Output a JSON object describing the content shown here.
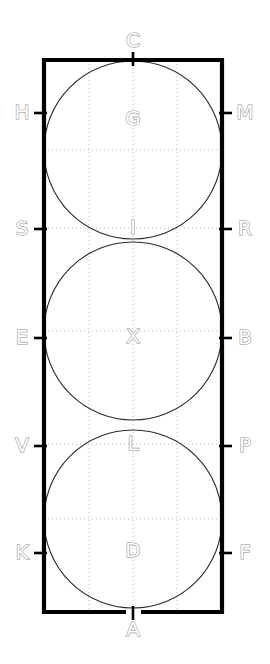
{
  "diagram": {
    "colors": {
      "frame": "#000000",
      "circle": "#2b2b2b",
      "grid": "#b9b9b9",
      "label_stroke": "#8c8c8c",
      "label_fill": "#ffffff",
      "background": "#ffffff"
    },
    "frame": {
      "left": 44,
      "right": 222,
      "top": 60,
      "bottom": 612,
      "width": 178,
      "height": 552
    },
    "circles": [
      {
        "id": "circle-top",
        "cx": 133,
        "cy": 150,
        "r": 89,
        "inner_label": "G"
      },
      {
        "id": "circle-middle",
        "cx": 133,
        "cy": 331,
        "r": 89,
        "inner_label": "X"
      },
      {
        "id": "circle-bottom",
        "cx": 133,
        "cy": 519,
        "r": 89,
        "inner_label": "D"
      }
    ],
    "labels": {
      "top": {
        "text": "C",
        "x": 133,
        "y": 41
      },
      "bottom": {
        "text": "A",
        "x": 133,
        "y": 630
      },
      "left": [
        {
          "text": "H",
          "x": 22,
          "y": 113
        },
        {
          "text": "S",
          "x": 22,
          "y": 229
        },
        {
          "text": "E",
          "x": 22,
          "y": 338
        },
        {
          "text": "V",
          "x": 22,
          "y": 446
        },
        {
          "text": "K",
          "x": 22,
          "y": 553
        }
      ],
      "right": [
        {
          "text": "M",
          "x": 245,
          "y": 113
        },
        {
          "text": "R",
          "x": 245,
          "y": 229
        },
        {
          "text": "B",
          "x": 245,
          "y": 338
        },
        {
          "text": "P",
          "x": 245,
          "y": 446
        },
        {
          "text": "F",
          "x": 245,
          "y": 553
        }
      ],
      "interior": [
        {
          "text": "G",
          "x": 133,
          "y": 119
        },
        {
          "text": "I",
          "x": 133,
          "y": 228
        },
        {
          "text": "X",
          "x": 133,
          "y": 337
        },
        {
          "text": "L",
          "x": 133,
          "y": 444
        },
        {
          "text": "D",
          "x": 133,
          "y": 551
        }
      ]
    },
    "ticks": {
      "left_y": [
        113,
        229,
        338,
        446,
        553
      ],
      "right_y": [
        113,
        229,
        338,
        446,
        553
      ],
      "top_x": 133,
      "bottom_x": 133
    },
    "grid": {
      "vertical_x": [
        89,
        133,
        177
      ],
      "horizontal_y": [
        150,
        228,
        331,
        444,
        519
      ]
    },
    "all_letters": [
      "C",
      "H",
      "M",
      "G",
      "S",
      "R",
      "I",
      "E",
      "B",
      "X",
      "V",
      "P",
      "L",
      "K",
      "F",
      "D",
      "A"
    ]
  }
}
